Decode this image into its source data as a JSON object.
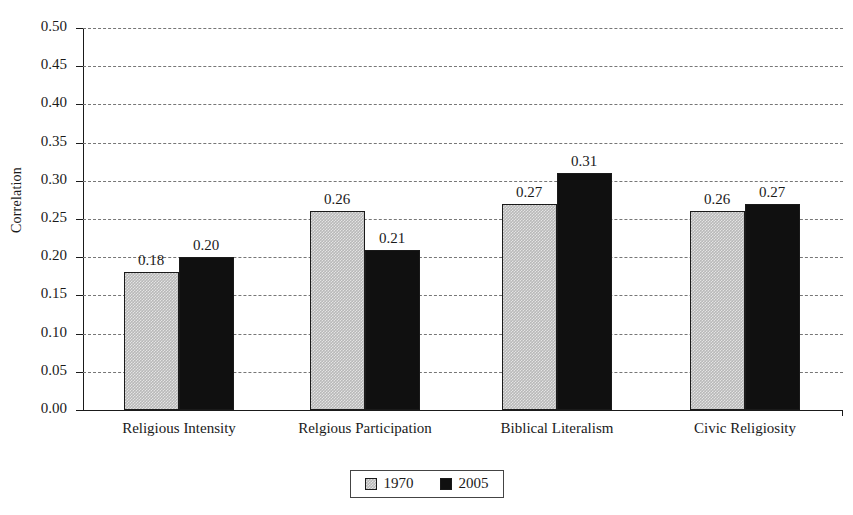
{
  "chart_data": {
    "type": "bar",
    "title": "",
    "xlabel": "",
    "ylabel": "Correlation",
    "ylim": [
      0.0,
      0.5
    ],
    "ytick_step": 0.05,
    "grid": true,
    "legend_position": "bottom-center",
    "categories": [
      "Religious Intensity",
      "Relgious Participation",
      "Biblical Literalism",
      "Civic Religiosity"
    ],
    "series": [
      {
        "name": "1970",
        "color": "#b8b8b8",
        "values": [
          0.18,
          0.26,
          0.27,
          0.26
        ],
        "value_labels": [
          "0.18",
          "0.26",
          "0.27",
          "0.26"
        ]
      },
      {
        "name": "2005",
        "color": "#101010",
        "values": [
          0.2,
          0.21,
          0.31,
          0.27
        ],
        "value_labels": [
          "0.20",
          "0.21",
          "0.31",
          "0.27"
        ]
      }
    ],
    "ytick_labels": [
      "0.00",
      "0.05",
      "0.10",
      "0.15",
      "0.20",
      "0.25",
      "0.30",
      "0.35",
      "0.40",
      "0.45",
      "0.50"
    ],
    "ytick_values": [
      0.0,
      0.05,
      0.1,
      0.15,
      0.2,
      0.25,
      0.3,
      0.35,
      0.4,
      0.45,
      0.5
    ]
  },
  "legend": {
    "entries": [
      {
        "label": "1970"
      },
      {
        "label": "2005"
      }
    ]
  }
}
